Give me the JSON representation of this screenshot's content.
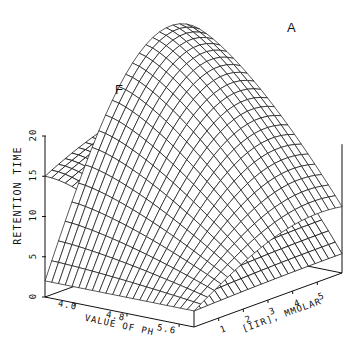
{
  "chart_data": {
    "type": "surface3d",
    "title": "",
    "zlabel": "RETENTION TIME",
    "xlabel": "VALUE OF PH",
    "ylabel": "[IIR], MMOLAR",
    "z_ticks": [
      "0",
      "5",
      "10",
      "15",
      "20"
    ],
    "x_ticks": [
      "4.0",
      "4.8",
      "5.6"
    ],
    "y_ticks": [
      "1",
      "2",
      "3",
      "4",
      "5"
    ],
    "zlim": [
      0,
      20
    ],
    "xlim": [
      3.6,
      5.8
    ],
    "ylim": [
      0,
      6
    ],
    "grid": false,
    "series": [
      {
        "name": "F",
        "description": "Retention surface for F: high (~20) at low pH / high IIR plateau, falling to ~10 at low pH low IIR and ~2 at high pH"
      },
      {
        "name": "A",
        "description": "Retention surface for A: rises strongly with IIR concentration, peaking near ~25 at high IIR, decreasing toward high pH"
      }
    ]
  },
  "labels": {
    "surface_f": "F",
    "surface_a": "A",
    "z_axis": "RETENTION TIME",
    "x_axis": "VALUE OF PH",
    "y_axis": "[IIR], MMOLAR"
  }
}
